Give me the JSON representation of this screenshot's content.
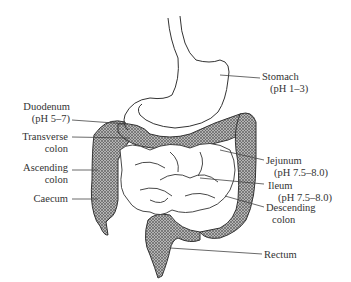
{
  "diagram": {
    "labels": {
      "stomach": {
        "name": "Stomach",
        "detail": "(pH 1–3)"
      },
      "duodenum": {
        "name": "Duodenum",
        "detail": "(pH 5–7)"
      },
      "transverse_colon": {
        "name": "Transverse",
        "detail": "colon"
      },
      "ascending_colon": {
        "name": "Ascending",
        "detail": "colon"
      },
      "caecum": {
        "name": "Caecum"
      },
      "jejunum": {
        "name": "Jejunum",
        "detail": "(pH 7.5–8.0)"
      },
      "ileum": {
        "name": "Ileum",
        "detail": "(pH 7.5–8.0)"
      },
      "descending_colon": {
        "name": "Descending",
        "detail": "colon"
      },
      "rectum": {
        "name": "Rectum"
      }
    },
    "colors": {
      "outline": "#333333",
      "hatch_fill": "#9a9a9a",
      "background": "#ffffff"
    }
  }
}
